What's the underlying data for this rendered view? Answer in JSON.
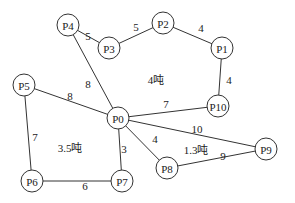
{
  "diagram": {
    "type": "weighted-graph",
    "nodes": [
      {
        "id": "P0",
        "x": 118,
        "y": 118
      },
      {
        "id": "P1",
        "x": 222,
        "y": 48
      },
      {
        "id": "P2",
        "x": 163,
        "y": 23
      },
      {
        "id": "P3",
        "x": 109,
        "y": 48
      },
      {
        "id": "P4",
        "x": 68,
        "y": 25
      },
      {
        "id": "P5",
        "x": 24,
        "y": 85
      },
      {
        "id": "P6",
        "x": 32,
        "y": 181
      },
      {
        "id": "P7",
        "x": 122,
        "y": 181
      },
      {
        "id": "P8",
        "x": 167,
        "y": 168
      },
      {
        "id": "P9",
        "x": 266,
        "y": 149
      },
      {
        "id": "P10",
        "x": 218,
        "y": 106
      }
    ],
    "edges": [
      {
        "from": "P4",
        "to": "P3",
        "weight": "5",
        "lx": 88,
        "ly": 36
      },
      {
        "from": "P3",
        "to": "P2",
        "weight": "5",
        "lx": 136,
        "ly": 27
      },
      {
        "from": "P2",
        "to": "P1",
        "weight": "4",
        "lx": 201,
        "ly": 28
      },
      {
        "from": "P1",
        "to": "P10",
        "weight": "4",
        "lx": 229,
        "ly": 80
      },
      {
        "from": "P10",
        "to": "P0",
        "weight": "7",
        "lx": 166,
        "ly": 104
      },
      {
        "from": "P4",
        "to": "P0",
        "weight": "8",
        "lx": 88,
        "ly": 84
      },
      {
        "from": "P5",
        "to": "P0",
        "weight": "8",
        "lx": 70,
        "ly": 96
      },
      {
        "from": "P5",
        "to": "P6",
        "weight": "7",
        "lx": 35,
        "ly": 137
      },
      {
        "from": "P6",
        "to": "P7",
        "weight": "6",
        "lx": 85,
        "ly": 186
      },
      {
        "from": "P7",
        "to": "P0",
        "weight": "3",
        "lx": 124,
        "ly": 149
      },
      {
        "from": "P0",
        "to": "P8",
        "weight": "4",
        "lx": 155,
        "ly": 139
      },
      {
        "from": "P0",
        "to": "P9",
        "weight": "10",
        "lx": 197,
        "ly": 129
      },
      {
        "from": "P8",
        "to": "P9",
        "weight": "9",
        "lx": 223,
        "ly": 156
      }
    ],
    "regions": [
      {
        "label": "4吨",
        "x": 156,
        "y": 80
      },
      {
        "label": "3.5吨",
        "x": 70,
        "y": 148
      },
      {
        "label": "1.3吨",
        "x": 196,
        "y": 150
      }
    ]
  }
}
